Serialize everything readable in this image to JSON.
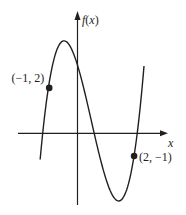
{
  "chart_data": {
    "type": "line",
    "title": "",
    "xlabel": "x",
    "ylabel": "f(x)",
    "grid": false,
    "xlim": [
      -2.1,
      3.2
    ],
    "ylim": [
      -3.2,
      5.3
    ],
    "function": {
      "form": "cubic",
      "roots": [
        -1.23,
        0.59,
        2.11
      ],
      "leading_coefficient": 1.96,
      "domain": [
        -1.32,
        2.35
      ]
    },
    "key_features": {
      "local_max": {
        "x": -0.43,
        "y": 4.1
      },
      "local_min": {
        "x": 1.51,
        "y": -3.0
      },
      "y_intercept": 3.0
    },
    "points": [
      {
        "x": -1,
        "y": 2,
        "label": "(−1, 2)",
        "label_side": "left"
      },
      {
        "x": 2,
        "y": -1,
        "label": "(2, −1)",
        "label_side": "right"
      }
    ]
  }
}
